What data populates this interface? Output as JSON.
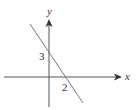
{
  "diagram": {
    "type": "coordinate-plane-line",
    "axes": {
      "x_label": "x",
      "y_label": "y",
      "color": "#555555"
    },
    "line": {
      "y_intercept_label": "3",
      "x_intercept_label": "2",
      "y_intercept": 3,
      "x_intercept": 2,
      "color": "#666666"
    }
  }
}
